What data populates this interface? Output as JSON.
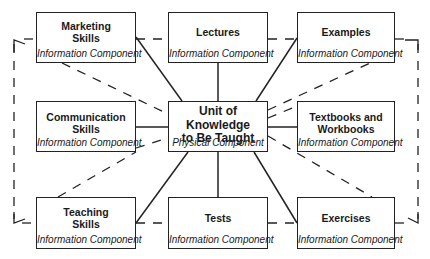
{
  "diagram": {
    "center": {
      "title_lines": [
        "Unit of",
        "Knowledge",
        "to Be Taught"
      ],
      "subtitle": "Physical Component"
    },
    "nodes": [
      {
        "id": "marketing",
        "title_lines": [
          "Marketing",
          "Skills"
        ],
        "subtitle": "Information Component"
      },
      {
        "id": "lectures",
        "title_lines": [
          "Lectures"
        ],
        "subtitle": "Information Component"
      },
      {
        "id": "examples",
        "title_lines": [
          "Examples"
        ],
        "subtitle": "Information Component"
      },
      {
        "id": "communication",
        "title_lines": [
          "Communication",
          "Skills"
        ],
        "subtitle": "Information Component"
      },
      {
        "id": "textbooks",
        "title_lines": [
          "Textbooks and",
          "Workbooks"
        ],
        "subtitle": "Information Component"
      },
      {
        "id": "teaching",
        "title_lines": [
          "Teaching",
          "Skills"
        ],
        "subtitle": "Information Component"
      },
      {
        "id": "tests",
        "title_lines": [
          "Tests"
        ],
        "subtitle": "Information Component"
      },
      {
        "id": "exercises",
        "title_lines": [
          "Exercises"
        ],
        "subtitle": "Information Component"
      }
    ],
    "edges_solid": [
      [
        "center",
        "marketing"
      ],
      [
        "center",
        "lectures"
      ],
      [
        "center",
        "examples"
      ],
      [
        "center",
        "communication"
      ],
      [
        "center",
        "textbooks"
      ],
      [
        "center",
        "teaching"
      ],
      [
        "center",
        "tests"
      ],
      [
        "center",
        "exercises"
      ]
    ],
    "edges_dashed": [
      [
        "marketing",
        "lectures"
      ],
      [
        "lectures",
        "examples"
      ],
      [
        "teaching",
        "tests"
      ],
      [
        "tests",
        "exercises"
      ],
      [
        "marketing",
        "center"
      ],
      [
        "communication",
        "examples"
      ],
      [
        "center",
        "exercises"
      ],
      [
        "textbooks",
        "center"
      ],
      [
        "outer-loop",
        "clockwise-return"
      ]
    ],
    "colors": {
      "stroke": "#222222",
      "background": "#ffffff",
      "text": "#1a1a1a"
    }
  }
}
